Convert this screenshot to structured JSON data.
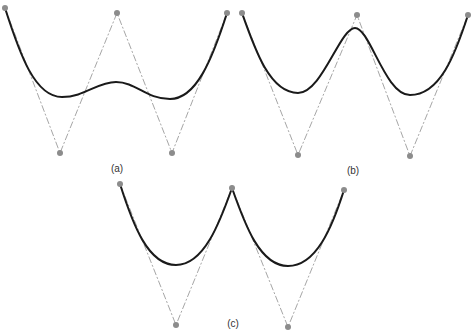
{
  "colors": {
    "background": "#ffffff",
    "curve": "#1a1a1a",
    "control_polygon": "#a6a6a6",
    "control_point": "#8c8c8c",
    "label": "#333333"
  },
  "panels": [
    {
      "id": "a",
      "label": "(a)",
      "label_pos": [
        117,
        168
      ],
      "control_points": [
        [
          5,
          8
        ],
        [
          60,
          153
        ],
        [
          117,
          13
        ],
        [
          172,
          153
        ],
        [
          227,
          13
        ]
      ],
      "curve": "M5,8 C20,55 35,97 62,97 C85,97 97,82 116,82 C136,82 146,99 170,99 C196,99 212,60 227,13"
    },
    {
      "id": "b",
      "label": "(b)",
      "label_pos": [
        353,
        170
      ],
      "control_points": [
        [
          242,
          13
        ],
        [
          298,
          155
        ],
        [
          357,
          15
        ],
        [
          410,
          156
        ],
        [
          468,
          15
        ]
      ],
      "curve": "M242,13 C255,50 270,93 298,93 C322,93 340,28 355,28 C370,28 385,95 410,95 C440,95 455,55 468,15"
    },
    {
      "id": "c",
      "label": "(c)",
      "label_pos": [
        233,
        323
      ],
      "control_points": [
        [
          120,
          184
        ],
        [
          176,
          325
        ],
        [
          232,
          188
        ],
        [
          288,
          327
        ],
        [
          344,
          190
        ]
      ],
      "curve": "M120,184 C133,225 148,265 176,265 C204,265 220,222 232,188 C245,225 260,266 288,266 C316,266 332,228 344,190"
    }
  ]
}
